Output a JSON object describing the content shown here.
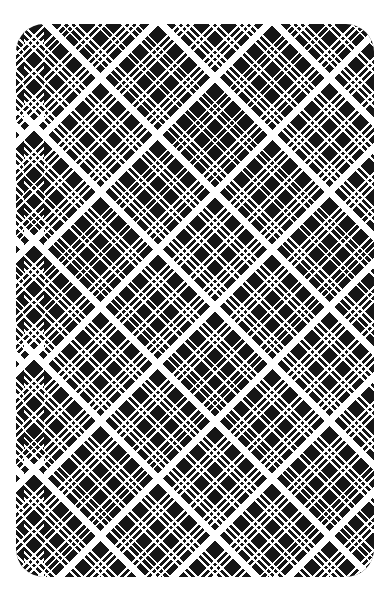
{
  "scene": {
    "subject": "playing card back",
    "pattern": "diagonal black-and-white tartan plaid",
    "colors": {
      "background": "#ffffff",
      "card_base": "#161616",
      "stripes": "#ffffff"
    }
  }
}
